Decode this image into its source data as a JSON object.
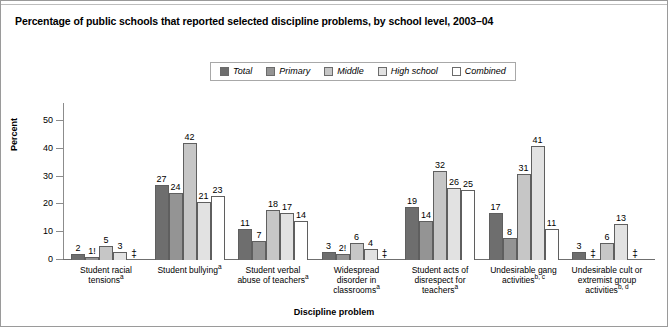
{
  "figure": {
    "title": "Percentage of public schools that reported selected discipline problems, by school level, 2003–04"
  },
  "chart_data": {
    "type": "bar",
    "title": "Percentage of public schools that reported selected discipline problems, by school level, 2003–04",
    "xlabel": "Discipline problem",
    "ylabel": "Percent",
    "ylim": [
      0,
      55
    ],
    "yticks": [
      0,
      10,
      20,
      30,
      40,
      50
    ],
    "ytick_labels": [
      "0",
      "10",
      "20",
      "30",
      "40",
      "50"
    ],
    "grid": false,
    "legend_position": "top-center",
    "categories": [
      "Student racial tensions",
      "Student bullying",
      "Student verbal abuse of teachers",
      "Widespread disorder in classrooms",
      "Student acts of disrespect for teachers",
      "Undesirable gang activities",
      "Undesirable cult or extremist group activities"
    ],
    "category_lines": [
      [
        "Student racial",
        "tensions"
      ],
      [
        "Student bullying"
      ],
      [
        "Student verbal",
        "abuse of teachers"
      ],
      [
        "Widespread",
        "disorder in",
        "classrooms"
      ],
      [
        "Student acts of",
        "disrespect for",
        "teachers"
      ],
      [
        "Undesirable gang",
        "activities"
      ],
      [
        "Undesirable cult or",
        "extremist group",
        "activities"
      ]
    ],
    "category_footnotes": [
      "a",
      "a",
      "a",
      "a",
      "a",
      "b, c",
      "b, d"
    ],
    "series": [
      {
        "name": "Total",
        "color": "#6e6e6e",
        "values": [
          2,
          27,
          11,
          3,
          19,
          17,
          3
        ],
        "labels": [
          "2",
          "27",
          "11",
          "3",
          "19",
          "17",
          "3"
        ]
      },
      {
        "name": "Primary",
        "color": "#949494",
        "values": [
          1,
          24,
          7,
          2,
          14,
          8,
          null
        ],
        "labels": [
          "1!",
          "24",
          "7",
          "2!",
          "14",
          "8",
          "‡"
        ]
      },
      {
        "name": "Middle",
        "color": "#c6c6c6",
        "values": [
          5,
          42,
          18,
          6,
          32,
          31,
          6
        ],
        "labels": [
          "5",
          "42",
          "18",
          "6",
          "32",
          "31",
          "6"
        ]
      },
      {
        "name": "High school",
        "color": "#e2e2e2",
        "values": [
          3,
          21,
          17,
          4,
          26,
          41,
          13
        ],
        "labels": [
          "3",
          "21",
          "17",
          "4",
          "26",
          "41",
          "13"
        ]
      },
      {
        "name": "Combined",
        "color": "#ffffff",
        "values": [
          null,
          23,
          14,
          null,
          25,
          11,
          null
        ],
        "labels": [
          "‡",
          "23",
          "14",
          "‡",
          "25",
          "11",
          "‡"
        ]
      }
    ],
    "suppressed_symbol": "‡",
    "unstable_symbol": "!"
  }
}
